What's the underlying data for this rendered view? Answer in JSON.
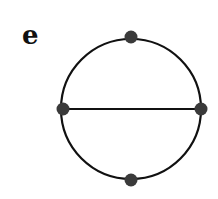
{
  "panel": {
    "label": "e"
  },
  "graph": {
    "circle": {
      "cx": 131,
      "cy": 109,
      "r": 70
    },
    "nodes": [
      {
        "id": "top",
        "x": 131,
        "y": 37
      },
      {
        "id": "left",
        "x": 63,
        "y": 109
      },
      {
        "id": "right",
        "x": 201,
        "y": 109
      },
      {
        "id": "bottom",
        "x": 131,
        "y": 180
      }
    ],
    "edges": [
      {
        "from": "left",
        "to": "right"
      }
    ],
    "colors": {
      "stroke": "#111111",
      "node": "#3a3a3a"
    }
  }
}
